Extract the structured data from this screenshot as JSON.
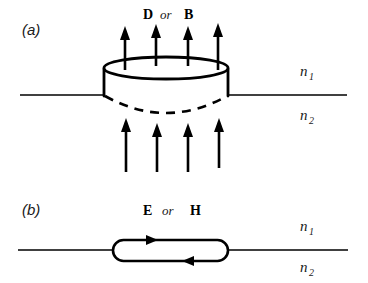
{
  "figure": {
    "background_color": "#ffffff",
    "line_color": "#000000",
    "width": 368,
    "height": 283
  },
  "panels": [
    {
      "tag": "(a)",
      "construct": "gaussian-pillbox",
      "field_label": {
        "first": "D",
        "conjunction": "or",
        "second": "B"
      },
      "media": {
        "upper": {
          "symbol": "n",
          "subscript": "1"
        },
        "lower": {
          "symbol": "n",
          "subscript": "2"
        }
      },
      "arrows_above": 4,
      "arrows_below": 4,
      "arrow_direction": "up"
    },
    {
      "tag": "(b)",
      "construct": "amperian-loop",
      "field_label": {
        "first": "E",
        "conjunction": "or",
        "second": "H"
      },
      "media": {
        "upper": {
          "symbol": "n",
          "subscript": "1"
        },
        "lower": {
          "symbol": "n",
          "subscript": "2"
        }
      },
      "loop_arrows": [
        {
          "position": "top",
          "direction": "right"
        },
        {
          "position": "bottom",
          "direction": "left"
        }
      ]
    }
  ]
}
